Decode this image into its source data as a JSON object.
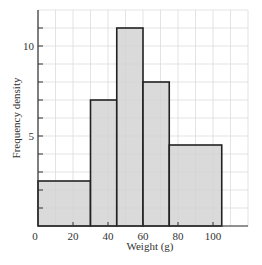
{
  "chart_data": {
    "type": "bar",
    "subtype": "histogram",
    "title": "",
    "xlabel": "Weight (g)",
    "ylabel": "Frequency density",
    "xlim": [
      0,
      120
    ],
    "ylim": [
      0,
      12
    ],
    "x_ticks": [
      0,
      20,
      40,
      60,
      80,
      100
    ],
    "x_tick_labels": [
      "0",
      "20",
      "40",
      "60",
      "80",
      "100"
    ],
    "y_ticks": [
      5,
      10
    ],
    "y_tick_labels": [
      "5",
      "10"
    ],
    "grid": true,
    "grid_step_x": 10,
    "grid_step_y": 1,
    "bins": [
      {
        "start": 0,
        "end": 30,
        "value": 2.5
      },
      {
        "start": 30,
        "end": 45,
        "value": 7
      },
      {
        "start": 45,
        "end": 60,
        "value": 11
      },
      {
        "start": 60,
        "end": 75,
        "value": 8
      },
      {
        "start": 75,
        "end": 105,
        "value": 4.5
      }
    ],
    "categories": [
      "0-30",
      "30-45",
      "45-60",
      "60-75",
      "75-105"
    ],
    "values": [
      2.5,
      7,
      11,
      8,
      4.5
    ],
    "colors": {
      "bar_fill": "#d4d4d4",
      "bar_stroke": "#222222",
      "grid": "#dcdcdc",
      "axis": "#333333"
    }
  }
}
